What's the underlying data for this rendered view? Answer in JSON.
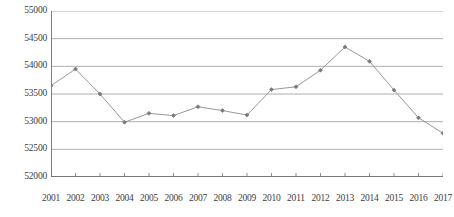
{
  "chart_data": {
    "type": "line",
    "title": "",
    "subtitle": "",
    "xlabel": "年",
    "ylabel": "",
    "grid": true,
    "legend": false,
    "legend_position": "none",
    "xlim": [
      "2001",
      "2017"
    ],
    "ylim": [
      52000,
      55000
    ],
    "ytick_interval": 500,
    "ytick_labels": [
      "55000",
      "54500",
      "54000",
      "53500",
      "53000",
      "52500",
      "52000"
    ],
    "ytick_values": [
      55000,
      54500,
      54000,
      53500,
      53000,
      52500,
      52000
    ],
    "categories": [
      "2001",
      "2002",
      "2003",
      "2004",
      "2005",
      "2006",
      "2007",
      "2008",
      "2009",
      "2010",
      "2011",
      "2012",
      "2013",
      "2014",
      "2015",
      "2016",
      "2017"
    ],
    "values": [
      53650,
      53950,
      53500,
      52990,
      53150,
      53110,
      53270,
      53200,
      53120,
      53580,
      53630,
      53930,
      54350,
      54090,
      53570,
      53070,
      52790
    ],
    "series": [
      {
        "name": "",
        "values": [
          53650,
          53950,
          53500,
          52990,
          53150,
          53110,
          53270,
          53200,
          53120,
          53580,
          53630,
          53930,
          54350,
          54090,
          53570,
          53070,
          52790
        ]
      }
    ],
    "marker": "diamond",
    "colors": {
      "line": "#8c8c8c",
      "marker": "#7a7a7a",
      "grid": "#9a9a9a",
      "axis": "#6e6e6e",
      "text": "#3d3d3d",
      "background": "#ffffff"
    }
  },
  "axis": {
    "x_unit": "年"
  }
}
